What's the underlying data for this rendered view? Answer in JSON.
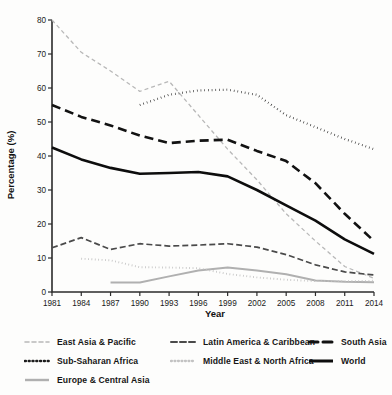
{
  "chart_data": {
    "type": "line",
    "title": "",
    "xlabel": "Year",
    "ylabel": "Percentage (%)",
    "x": [
      1981,
      1984,
      1987,
      1990,
      1993,
      1996,
      1999,
      2002,
      2005,
      2008,
      2011,
      2014
    ],
    "xlim": [
      1981,
      2014
    ],
    "ylim": [
      0,
      80
    ],
    "yticks": [
      0,
      10,
      20,
      30,
      40,
      50,
      60,
      70,
      80
    ],
    "xticks": [
      "1981",
      "1984",
      "1987",
      "1990",
      "1993",
      "1996",
      "1999",
      "2002",
      "2005",
      "2008",
      "2011",
      "2014"
    ],
    "grid": false,
    "legend_position": "bottom",
    "series": [
      {
        "name": "East Asia & Pacific",
        "style": "dashed",
        "color": "#b8b8b8",
        "width": 1.3,
        "dash": "4,3",
        "x": [
          1981,
          1984,
          1987,
          1990,
          1993,
          1996,
          1999,
          2002,
          2005,
          2008,
          2011,
          2014
        ],
        "values": [
          80.0,
          70.5,
          65.0,
          59.0,
          62.0,
          52.0,
          42.0,
          33.0,
          23.0,
          15.0,
          7.5,
          4.0
        ]
      },
      {
        "name": "Sub-Saharan Africa",
        "style": "dotted",
        "color": "#1c1c1c",
        "width": 2.2,
        "dash": "0.6,3.1",
        "x": [
          1990,
          1993,
          1996,
          1999,
          2002,
          2005,
          2008,
          2011,
          2014
        ],
        "values": [
          55.0,
          58.0,
          59.3,
          59.5,
          58.0,
          52.0,
          48.5,
          45.0,
          42.0
        ]
      },
      {
        "name": "Europe & Central Asia",
        "style": "solid",
        "color": "#b0b0b0",
        "width": 2.0,
        "dash": "",
        "x": [
          1987,
          1990,
          1993,
          1996,
          1999,
          2002,
          2005,
          2008,
          2011,
          2014
        ],
        "values": [
          2.8,
          2.8,
          4.6,
          6.3,
          7.2,
          6.3,
          5.2,
          3.4,
          3.0,
          2.9
        ]
      },
      {
        "name": "Latin America & Caribbean",
        "style": "dashed",
        "color": "#4a4a4a",
        "width": 1.7,
        "dash": "6,3",
        "x": [
          1981,
          1984,
          1987,
          1990,
          1993,
          1996,
          1999,
          2002,
          2005,
          2008,
          2011,
          2014
        ],
        "values": [
          13.0,
          16.0,
          12.5,
          14.2,
          13.5,
          13.8,
          14.2,
          13.2,
          11.0,
          8.0,
          5.9,
          5.0
        ]
      },
      {
        "name": "Middle East & North Africa",
        "style": "dotted",
        "color": "#c2c2c2",
        "width": 1.9,
        "dash": "0.8,2.6",
        "x": [
          1984,
          1987,
          1990,
          1993,
          1996,
          1999,
          2002,
          2005,
          2008,
          2011,
          2014
        ],
        "values": [
          9.8,
          9.3,
          7.3,
          7.2,
          7.0,
          5.3,
          4.3,
          3.6,
          3.2,
          3.2,
          3.3
        ]
      },
      {
        "name": "South Asia",
        "style": "dashed",
        "color": "#121212",
        "width": 2.6,
        "dash": "9,5",
        "x": [
          1981,
          1984,
          1987,
          1990,
          1993,
          1996,
          1999,
          2002,
          2005,
          2008,
          2011,
          2014
        ],
        "values": [
          55.0,
          51.5,
          49.0,
          46.0,
          43.8,
          44.5,
          44.8,
          41.5,
          38.5,
          32.0,
          23.0,
          15.0
        ]
      },
      {
        "name": "World",
        "style": "solid",
        "color": "#0d0d0d",
        "width": 2.6,
        "dash": "",
        "x": [
          1981,
          1984,
          1987,
          1990,
          1993,
          1996,
          1999,
          2002,
          2005,
          2008,
          2011,
          2014
        ],
        "values": [
          42.5,
          39.0,
          36.5,
          34.8,
          35.0,
          35.3,
          34.0,
          30.0,
          25.5,
          21.0,
          15.5,
          11.2
        ]
      }
    ]
  },
  "axes": {
    "ylabel": "Percentage (%)",
    "xlabel": "Year",
    "yticks": [
      "0",
      "10",
      "20",
      "30",
      "40",
      "50",
      "60",
      "70",
      "80"
    ],
    "xticks": [
      "1981",
      "1984",
      "1987",
      "1990",
      "1993",
      "1996",
      "1999",
      "2002",
      "2005",
      "2008",
      "2011",
      "2014"
    ]
  },
  "legend": {
    "items": [
      {
        "label": "East Asia & Pacific",
        "color": "#b8b8b8",
        "dash": "4,3",
        "width": 1.6
      },
      {
        "label": "Latin America & Caribbean",
        "color": "#4a4a4a",
        "dash": "6,3",
        "width": 2.0
      },
      {
        "label": "South Asia",
        "color": "#121212",
        "dash": "9,5",
        "width": 3.0
      },
      {
        "label": "Sub-Saharan Africa",
        "color": "#1c1c1c",
        "dash": "0.8,3.0",
        "width": 2.6
      },
      {
        "label": "Middle East & North Africa",
        "color": "#c2c2c2",
        "dash": "0.9,2.6",
        "width": 2.3
      },
      {
        "label": "World",
        "color": "#0d0d0d",
        "dash": "",
        "width": 3.0
      },
      {
        "label": "Europe & Central Asia",
        "color": "#b0b0b0",
        "dash": "",
        "width": 2.4
      }
    ]
  }
}
